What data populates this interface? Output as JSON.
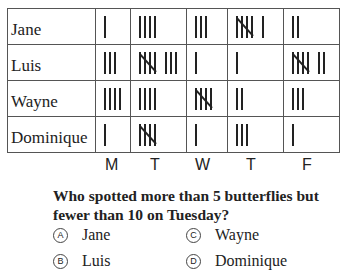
{
  "table": {
    "days": [
      "M",
      "T",
      "W",
      "T",
      "F"
    ],
    "rows": [
      {
        "name": "Jane",
        "counts": [
          1,
          4,
          3,
          6,
          2
        ]
      },
      {
        "name": "Luis",
        "counts": [
          3,
          8,
          1,
          1,
          7
        ]
      },
      {
        "name": "Wayne",
        "counts": [
          4,
          4,
          5,
          2,
          3
        ]
      },
      {
        "name": "Dominique",
        "counts": [
          1,
          5,
          1,
          3,
          1
        ]
      }
    ]
  },
  "question": {
    "text": "Who spotted more than 5 butterflies but fewer than 10 on Tuesday?",
    "options": [
      {
        "letter": "A",
        "label": "Jane"
      },
      {
        "letter": "B",
        "label": "Luis"
      },
      {
        "letter": "C",
        "label": "Wayne"
      },
      {
        "letter": "D",
        "label": "Dominique"
      }
    ]
  }
}
